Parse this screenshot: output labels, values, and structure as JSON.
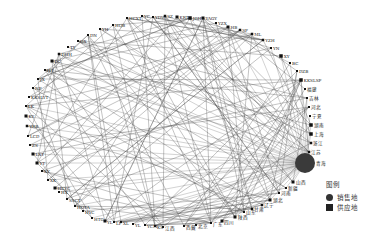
{
  "diagram": {
    "type": "circular-network",
    "legend": {
      "title": "图例",
      "items": [
        {
          "label": "销售地",
          "shape": "circle",
          "color": "#333333"
        },
        {
          "label": "供应地",
          "shape": "square",
          "color": "#222222"
        }
      ]
    },
    "hub": {
      "label": "青海",
      "x": 305,
      "y": 163,
      "r": 10,
      "color": "#3a3a3a"
    },
    "nodes": [
      {
        "label": "HCXT",
        "x": 127,
        "y": 18,
        "size": 2
      },
      {
        "label": "YC",
        "x": 142,
        "y": 16,
        "size": 2
      },
      {
        "label": "YDW",
        "x": 153,
        "y": 17,
        "size": 2
      },
      {
        "label": "SZ",
        "x": 165,
        "y": 16,
        "size": 2.5
      },
      {
        "label": "KRT",
        "x": 177,
        "y": 17,
        "size": 3
      },
      {
        "label": "JGH",
        "x": 190,
        "y": 18,
        "size": 3.5
      },
      {
        "label": "YAGY",
        "x": 203,
        "y": 18,
        "size": 3
      },
      {
        "label": "YZX",
        "x": 216,
        "y": 23,
        "size": 2
      },
      {
        "label": "HB",
        "x": 228,
        "y": 27,
        "size": 3
      },
      {
        "label": "SF",
        "x": 240,
        "y": 30,
        "size": 2.5
      },
      {
        "label": "ML",
        "x": 252,
        "y": 34,
        "size": 2.5
      },
      {
        "label": "YZH",
        "x": 263,
        "y": 40,
        "size": 2.5
      },
      {
        "label": "YN",
        "x": 271,
        "y": 48,
        "size": 2
      },
      {
        "label": "XY",
        "x": 281,
        "y": 56,
        "size": 3.5
      },
      {
        "label": "BC",
        "x": 290,
        "y": 63,
        "size": 2
      },
      {
        "label": "DZB",
        "x": 297,
        "y": 71,
        "size": 2
      },
      {
        "label": "KKSLSP",
        "x": 301,
        "y": 80,
        "size": 3.5
      },
      {
        "label": "福建",
        "x": 305,
        "y": 89,
        "size": 2,
        "cn": true
      },
      {
        "label": "吉林",
        "x": 307,
        "y": 98,
        "size": 2,
        "cn": true
      },
      {
        "label": "河北",
        "x": 309,
        "y": 107,
        "size": 2,
        "cn": true
      },
      {
        "label": "宁夏",
        "x": 310,
        "y": 116,
        "size": 2,
        "cn": true
      },
      {
        "label": "湖南",
        "x": 311,
        "y": 125,
        "size": 3.5,
        "cn": true
      },
      {
        "label": "上海",
        "x": 311,
        "y": 134,
        "size": 3.5,
        "cn": true
      },
      {
        "label": "浙江",
        "x": 311,
        "y": 143,
        "size": 2.5,
        "cn": true
      },
      {
        "label": "江苏",
        "x": 309,
        "y": 152,
        "size": 2.5,
        "cn": true
      },
      {
        "label": "山西",
        "x": 293,
        "y": 182,
        "size": 3,
        "cn": true
      },
      {
        "label": "新疆",
        "x": 286,
        "y": 188,
        "size": 2,
        "cn": true
      },
      {
        "label": "河南",
        "x": 279,
        "y": 193,
        "size": 2,
        "cn": true
      },
      {
        "label": "湖北",
        "x": 270,
        "y": 200,
        "size": 3,
        "cn": true
      },
      {
        "label": "辽宁",
        "x": 262,
        "y": 205,
        "size": 2.5,
        "cn": true
      },
      {
        "label": "甘肃",
        "x": 252,
        "y": 209,
        "size": 2.5,
        "cn": true
      },
      {
        "label": "山东",
        "x": 244,
        "y": 212,
        "size": 2,
        "cn": true
      },
      {
        "label": "陕西",
        "x": 235,
        "y": 217,
        "size": 3,
        "cn": true
      },
      {
        "label": "四川",
        "x": 222,
        "y": 221,
        "size": 3,
        "cn": true
      },
      {
        "label": "广东",
        "x": 211,
        "y": 223,
        "size": 2,
        "cn": true
      },
      {
        "label": "北京",
        "x": 196,
        "y": 225,
        "size": 2,
        "cn": true
      },
      {
        "label": "西藏",
        "x": 184,
        "y": 226,
        "size": 2,
        "cn": true
      },
      {
        "label": "江西",
        "x": 163,
        "y": 227,
        "size": 2,
        "cn": true
      },
      {
        "label": "KS",
        "x": 155,
        "y": 226,
        "size": 2
      },
      {
        "label": "YCM",
        "x": 145,
        "y": 225,
        "size": 2
      },
      {
        "label": "YL",
        "x": 133,
        "y": 224,
        "size": 2
      },
      {
        "label": "XL",
        "x": 121,
        "y": 222,
        "size": 2
      },
      {
        "label": "LF",
        "x": 114,
        "y": 222,
        "size": 2
      },
      {
        "label": "YL",
        "x": 105,
        "y": 221,
        "size": 3
      },
      {
        "label": "HTG",
        "x": 92,
        "y": 218,
        "size": 2
      },
      {
        "label": "HYC",
        "x": 83,
        "y": 211,
        "size": 2
      },
      {
        "label": "HOTA",
        "x": 75,
        "y": 206,
        "size": 2
      },
      {
        "label": "SSCT",
        "x": 67,
        "y": 199,
        "size": 2
      },
      {
        "label": "HX",
        "x": 59,
        "y": 192,
        "size": 2
      },
      {
        "label": "HCYC",
        "x": 55,
        "y": 188,
        "size": 3
      },
      {
        "label": "XK",
        "x": 48,
        "y": 180,
        "size": 2
      },
      {
        "label": "XY",
        "x": 42,
        "y": 171,
        "size": 2
      },
      {
        "label": "YT",
        "x": 37,
        "y": 163,
        "size": 3
      },
      {
        "label": "LXT",
        "x": 33,
        "y": 154,
        "size": 3
      },
      {
        "label": "ZS",
        "x": 30,
        "y": 145,
        "size": 2
      },
      {
        "label": "LCD",
        "x": 28,
        "y": 136,
        "size": 2
      },
      {
        "label": "YRB",
        "x": 27,
        "y": 126,
        "size": 2.5
      },
      {
        "label": "KY",
        "x": 26,
        "y": 116,
        "size": 3
      },
      {
        "label": "LK",
        "x": 26,
        "y": 106,
        "size": 2
      },
      {
        "label": "KKSLYT",
        "x": 29,
        "y": 97,
        "size": 2
      },
      {
        "label": "NP",
        "x": 33,
        "y": 88,
        "size": 2
      },
      {
        "label": "JX",
        "x": 38,
        "y": 79,
        "size": 2
      },
      {
        "label": "HT",
        "x": 45,
        "y": 70,
        "size": 2
      },
      {
        "label": "DC",
        "x": 52,
        "y": 61,
        "size": 3
      },
      {
        "label": "DHH",
        "x": 59,
        "y": 54,
        "size": 2.5
      },
      {
        "label": "TY",
        "x": 68,
        "y": 47,
        "size": 2
      },
      {
        "label": "QX",
        "x": 78,
        "y": 41,
        "size": 2
      },
      {
        "label": "DN",
        "x": 88,
        "y": 35,
        "size": 2
      },
      {
        "label": "YH",
        "x": 100,
        "y": 29,
        "size": 2
      },
      {
        "label": "HQB",
        "x": 113,
        "y": 25,
        "size": 2
      }
    ]
  }
}
